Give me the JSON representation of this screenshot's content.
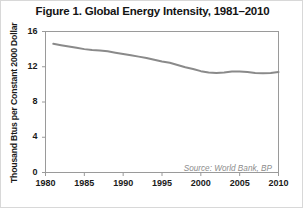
{
  "figure": {
    "title": "Figure 1. Global Energy Intensity, 1981–2010",
    "source_note": "Source: World Bank, BP",
    "line_color": "#8a8a8a",
    "axis_color": "#6e6e6e",
    "text_color": "#1a1a1a",
    "background": "#ffffff"
  },
  "chart_data": {
    "type": "line",
    "title": "Figure 1. Global Energy Intensity, 1981–2010",
    "xlabel": "",
    "ylabel": "Thousand Btus per Constant 2000 Dollar",
    "xlim": [
      1980,
      2010
    ],
    "ylim": [
      0,
      16
    ],
    "yticks": [
      0,
      4,
      8,
      12,
      16
    ],
    "ytick_labels": [
      "0",
      "4",
      "8",
      "12",
      "16"
    ],
    "xticks": [
      1980,
      1985,
      1990,
      1995,
      2000,
      2005,
      2010
    ],
    "xtick_labels": [
      "1980",
      "1985",
      "1990",
      "1995",
      "2000",
      "2005",
      "2010"
    ],
    "grid": false,
    "legend": false,
    "annotations": [
      "Source: World Bank, BP"
    ],
    "series": [
      {
        "name": "Global Energy Intensity",
        "color": "#8a8a8a",
        "x": [
          1981,
          1982,
          1983,
          1984,
          1985,
          1986,
          1987,
          1988,
          1989,
          1990,
          1991,
          1992,
          1993,
          1994,
          1995,
          1996,
          1997,
          1998,
          1999,
          2000,
          2001,
          2002,
          2003,
          2004,
          2005,
          2006,
          2007,
          2008,
          2009,
          2010
        ],
        "values": [
          14.6,
          14.45,
          14.3,
          14.15,
          14.0,
          13.9,
          13.85,
          13.75,
          13.6,
          13.45,
          13.3,
          13.15,
          13.0,
          12.8,
          12.6,
          12.45,
          12.2,
          11.95,
          11.75,
          11.5,
          11.35,
          11.3,
          11.35,
          11.45,
          11.45,
          11.4,
          11.3,
          11.25,
          11.3,
          11.4
        ]
      }
    ]
  }
}
